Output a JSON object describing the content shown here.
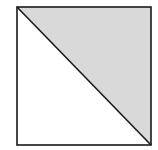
{
  "diagram": {
    "type": "square-split-by-diagonal",
    "square": {
      "x": 17,
      "y": 7,
      "size_w": 134,
      "size_h": 138
    },
    "diagonal": {
      "from": "top-left",
      "to": "bottom-right"
    },
    "shaded_region": "upper-right-triangle",
    "colors": {
      "background": "#ffffff",
      "shade": "#d9d9d9",
      "stroke": "#1a1a1a"
    },
    "stroke_width": 1.6
  }
}
